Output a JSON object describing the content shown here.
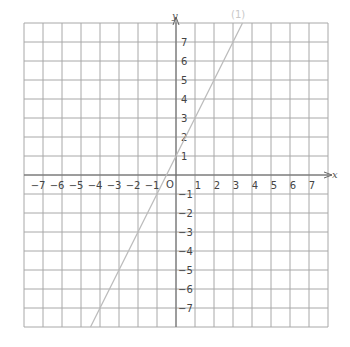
{
  "graph": {
    "x_axis_label": "x",
    "y_axis_label": "y",
    "origin_label": "O",
    "line_label": "(1)",
    "x_ticks": [
      "-7",
      "-6",
      "-5",
      "-4",
      "-3",
      "-2",
      "-1",
      "1",
      "2",
      "3",
      "4",
      "5",
      "6",
      "7"
    ],
    "y_ticks": [
      "7",
      "6",
      "5",
      "4",
      "3",
      "2",
      "1",
      "-1",
      "-2",
      "-3",
      "-4",
      "-5",
      "-6",
      "-7"
    ],
    "grid_range": [
      -8,
      8
    ],
    "line_color": "#bbbbbb",
    "grid_color": "#999999"
  },
  "chart_data": {
    "type": "line",
    "title": "",
    "xlabel": "x",
    "ylabel": "y",
    "xlim": [
      -8,
      8
    ],
    "ylim": [
      -8,
      8
    ],
    "grid": true,
    "series": [
      {
        "name": "(1)",
        "equation": "y = 2x + 1",
        "x": [
          -4.5,
          3.5
        ],
        "y": [
          -8,
          8
        ]
      }
    ]
  }
}
